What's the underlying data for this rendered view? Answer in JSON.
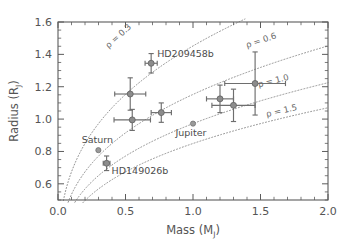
{
  "chart_data": {
    "type": "scatter",
    "title": "",
    "xlabel": "Mass (M_J)",
    "xlabel_base": "Mass (M",
    "xlabel_sub": "J",
    "xlabel_close": ")",
    "ylabel": "Radius (R_J)",
    "ylabel_base": "Radius (R",
    "ylabel_sub": "J",
    "ylabel_close": ")",
    "xlim": [
      0.0,
      2.0
    ],
    "ylim": [
      0.5,
      1.6
    ],
    "grid": false,
    "legend": "none",
    "xticks": [
      "0.0",
      "0.5",
      "1.0",
      "1.5",
      "2.0"
    ],
    "xtick_values": [
      0.0,
      0.5,
      1.0,
      1.5,
      2.0
    ],
    "yticks": [
      "0.6",
      "0.8",
      "1.0",
      "1.2",
      "1.4",
      "1.6"
    ],
    "ytick_values": [
      0.6,
      0.8,
      1.0,
      1.2,
      1.4,
      1.6
    ],
    "x_minor_step": 0.1,
    "y_minor_step": 0.05,
    "series": [
      {
        "name": "Transiting planets",
        "marker": "filled-circle-with-errorbars",
        "points": [
          {
            "label": "HD209458b",
            "x": 0.69,
            "y": 1.345,
            "xerr": 0.045,
            "yerr": 0.06,
            "label_dx": 6,
            "label_dy": -6
          },
          {
            "label": "",
            "x": 0.535,
            "y": 1.155,
            "xerr": 0.115,
            "yerr": 0.1,
            "label_dx": 0,
            "label_dy": 0
          },
          {
            "label": "",
            "x": 0.55,
            "y": 0.995,
            "xerr": 0.135,
            "yerr": 0.065,
            "label_dx": 0,
            "label_dy": 0
          },
          {
            "label": "",
            "x": 0.765,
            "y": 1.04,
            "xerr": 0.075,
            "yerr": 0.06,
            "label_dx": 0,
            "label_dy": 0
          },
          {
            "label": "",
            "x": 1.2,
            "y": 1.125,
            "xerr": 0.1,
            "yerr": 0.085,
            "label_dx": 0,
            "label_dy": 0
          },
          {
            "label": "",
            "x": 1.3,
            "y": 1.085,
            "xerr": 0.16,
            "yerr": 0.1,
            "label_dx": 0,
            "label_dy": 0
          },
          {
            "label": "",
            "x": 1.46,
            "y": 1.22,
            "xerr": 0.225,
            "yerr": 0.195,
            "label_dx": 0,
            "label_dy": 0
          },
          {
            "label": "HD149026b",
            "x": 0.36,
            "y": 0.727,
            "xerr": 0.025,
            "yerr": 0.045,
            "label_dx": 5,
            "label_dy": 11
          }
        ]
      },
      {
        "name": "Solar system planets",
        "marker": "filled-circle",
        "points": [
          {
            "label": "Saturn",
            "x": 0.299,
            "y": 0.808,
            "xerr": 0,
            "yerr": 0,
            "label_dx": -1,
            "label_dy": -7
          },
          {
            "label": "Jupiter",
            "x": 1.0,
            "y": 0.972,
            "xerr": 0,
            "yerr": 0,
            "label_dx": -2,
            "label_dy": 12
          }
        ]
      }
    ],
    "density_curves": [
      {
        "label": "ρ = 0.3",
        "rho": 0.3,
        "label_x": 0.46,
        "label_y": 1.5,
        "rotation": -42
      },
      {
        "label": "ρ = 0.6",
        "rho": 0.6,
        "label_x": 1.51,
        "label_y": 1.47,
        "rotation": -18
      },
      {
        "label": "ρ = 1.0",
        "rho": 1.0,
        "label_x": 1.6,
        "label_y": 1.22,
        "rotation": -14
      },
      {
        "label": "ρ = 1.5",
        "rho": 1.5,
        "label_x": 1.66,
        "label_y": 1.035,
        "rotation": -13
      }
    ],
    "annotations": [
      "HD209458b",
      "HD149026b",
      "Saturn",
      "Jupiter",
      "ρ = 0.3",
      "ρ = 0.6",
      "ρ = 1.0",
      "ρ = 1.5"
    ],
    "colors": {
      "background": "#ffffff",
      "axis": "#5b5b5b",
      "marker": "#8c8c8c",
      "errorbar": "#6e6e6e",
      "density_curve": "#909090",
      "text": "#4c4c4c"
    }
  }
}
